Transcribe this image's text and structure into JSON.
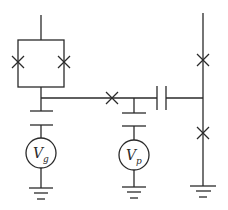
{
  "diagram": {
    "type": "circuit-schematic",
    "sources": [
      {
        "id": "gate-source",
        "label": "V",
        "subscript": "g"
      },
      {
        "id": "plunger-source",
        "label": "V",
        "subscript": "p"
      }
    ],
    "junction_count": 5,
    "capacitor_count": 3,
    "ground_count": 3,
    "colors": {
      "line": "#2a2a2a",
      "background": "#ffffff"
    }
  }
}
